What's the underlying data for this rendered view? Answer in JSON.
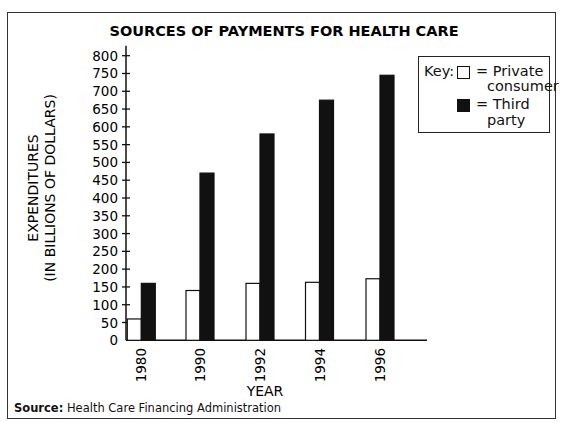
{
  "chart_data": {
    "type": "bar",
    "title": "SOURCES OF PAYMENTS FOR HEALTH CARE",
    "xlabel": "YEAR",
    "ylabel": [
      "EXPENDITURES",
      "(IN BILLIONS OF DOLLARS)"
    ],
    "categories": [
      "1980",
      "1990",
      "1992",
      "1994",
      "1996"
    ],
    "series": [
      {
        "name": "Private consumer",
        "fill": "#ffffff",
        "values": [
          60,
          140,
          160,
          163,
          173
        ]
      },
      {
        "name": "Third party",
        "fill": "#111111",
        "values": [
          160,
          470,
          580,
          675,
          745
        ]
      }
    ],
    "ylim": [
      0,
      800
    ],
    "yticks": [
      0,
      50,
      100,
      150,
      200,
      250,
      300,
      350,
      400,
      450,
      500,
      550,
      600,
      650,
      700,
      750,
      800
    ],
    "grid": false,
    "legend_position": "top-right",
    "tick_label_rotation_x": -90
  },
  "legend": {
    "key_label": "Key:",
    "items": [
      {
        "eq": "= Private",
        "line2": "consumer"
      },
      {
        "eq": "= Third",
        "line2": "party"
      }
    ]
  },
  "source": {
    "label": "Source:",
    "text": "Health Care Financing Administration"
  }
}
